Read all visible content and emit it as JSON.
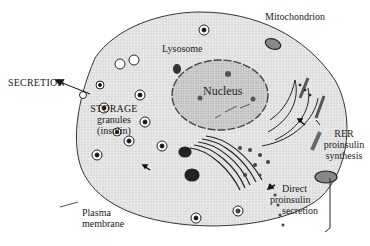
{
  "diagram": {
    "labels": {
      "mitochondrion": "Mitochondrion",
      "lysosome": "Lysosome",
      "nucleus": "Nucleus",
      "secretion": "SECRETION",
      "storage_line1": "STORAGE",
      "storage_line2": "granules",
      "storage_line3": "(insulin)",
      "rer_line1": "RER",
      "rer_line2": "proinsulin",
      "rer_line3": "synthesis",
      "direct_line1": "Direct",
      "direct_line2": "proinsulin",
      "direct_line3": "secretion",
      "plasma_line1": "Plasma",
      "plasma_line2": "membrane"
    },
    "colors": {
      "cytoplasm": "#e4e4e4",
      "nucleus": "#c9c9c9",
      "outline": "#333333"
    }
  }
}
